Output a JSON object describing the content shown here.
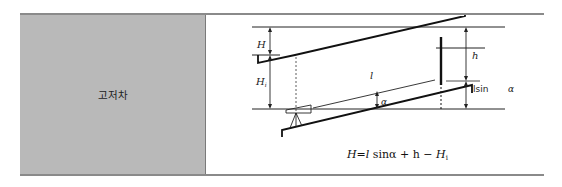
{
  "table": {
    "label": "고저차",
    "diagram": {
      "labels": {
        "H": "H",
        "Hi": "H",
        "Hi_sub": "i",
        "l": "l",
        "h": "h",
        "alpha_left": "α",
        "lsin": "lsin",
        "alpha_right": "α"
      },
      "formula": "H = l sinα + h − H",
      "formula_parts": {
        "lhs": "H",
        "eq": "=",
        "l": "l",
        "sin": "sin",
        "alpha": "α",
        "plus_h": "+ h",
        "minus": "−",
        "Hi": "H",
        "Hi_sub": "i"
      }
    }
  }
}
